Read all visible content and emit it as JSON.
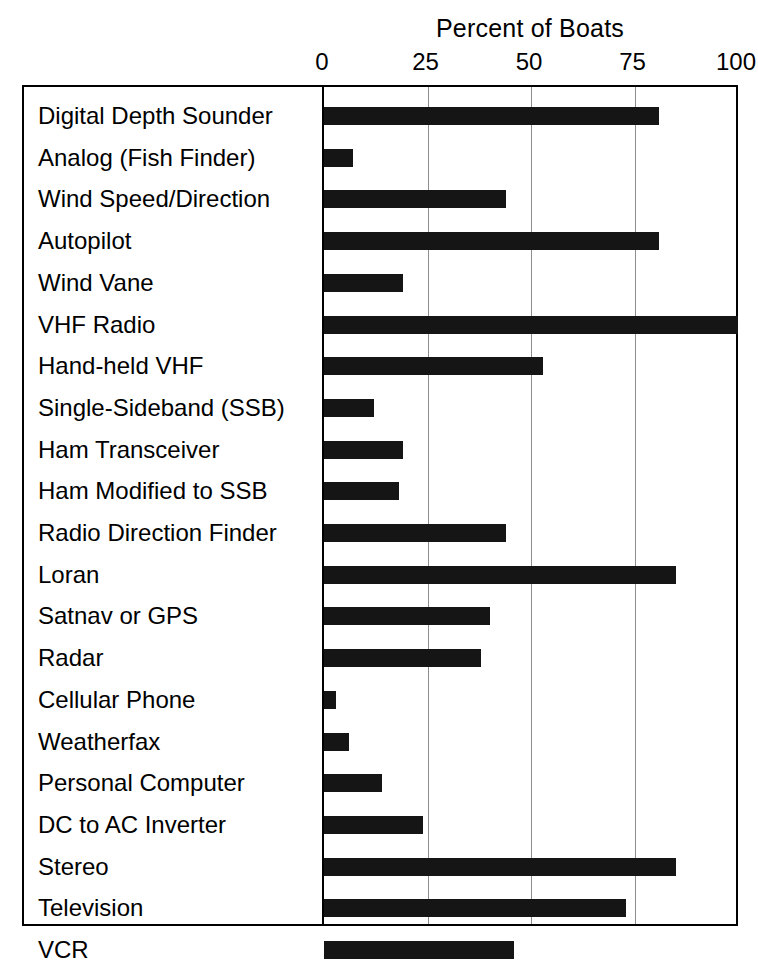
{
  "chart_data": {
    "type": "bar",
    "orientation": "horizontal",
    "title": "Percent of Boats",
    "xlabel": "",
    "ylabel": "",
    "xlim": [
      0,
      100
    ],
    "xticks": [
      0,
      25,
      50,
      75,
      100
    ],
    "xtick_labels": [
      "0",
      "25",
      "50",
      "75",
      "100"
    ],
    "grid": "vertical",
    "legend": "none",
    "bar_color": "#151515",
    "categories": [
      "Digital Depth Sounder",
      "Analog (Fish Finder)",
      "Wind Speed/Direction",
      "Autopilot",
      "Wind Vane",
      "VHF Radio",
      "Hand-held VHF",
      "Single-Sideband (SSB)",
      "Ham Transceiver",
      "Ham Modified to SSB",
      "Radio Direction Finder",
      "Loran",
      "Satnav or GPS",
      "Radar",
      "Cellular Phone",
      "Weatherfax",
      "Personal Computer",
      "DC to AC Inverter",
      "Stereo",
      "Television",
      "VCR"
    ],
    "values": [
      81,
      7,
      44,
      81,
      19,
      100,
      53,
      12,
      19,
      18,
      44,
      85,
      40,
      38,
      3,
      6,
      14,
      24,
      85,
      73,
      46
    ]
  },
  "chart": {
    "title": "Percent of Boats",
    "axis": {
      "ticks": [
        {
          "label": "0",
          "value": 0
        },
        {
          "label": "25",
          "value": 25
        },
        {
          "label": "50",
          "value": 50
        },
        {
          "label": "75",
          "value": 75
        },
        {
          "label": "100",
          "value": 100
        }
      ]
    },
    "rows": [
      {
        "label": "Digital Depth Sounder",
        "value": 81
      },
      {
        "label": "Analog (Fish Finder)",
        "value": 7
      },
      {
        "label": "Wind Speed/Direction",
        "value": 44
      },
      {
        "label": "Autopilot",
        "value": 81
      },
      {
        "label": "Wind Vane",
        "value": 19
      },
      {
        "label": "VHF Radio",
        "value": 100
      },
      {
        "label": "Hand-held VHF",
        "value": 53
      },
      {
        "label": "Single-Sideband (SSB)",
        "value": 12
      },
      {
        "label": "Ham Transceiver",
        "value": 19
      },
      {
        "label": "Ham Modified to SSB",
        "value": 18
      },
      {
        "label": "Radio Direction Finder",
        "value": 44
      },
      {
        "label": "Loran",
        "value": 85
      },
      {
        "label": "Satnav or GPS",
        "value": 40
      },
      {
        "label": "Radar",
        "value": 38
      },
      {
        "label": "Cellular Phone",
        "value": 3
      },
      {
        "label": "Weatherfax",
        "value": 6
      },
      {
        "label": "Personal Computer",
        "value": 14
      },
      {
        "label": "DC to AC Inverter",
        "value": 24
      },
      {
        "label": "Stereo",
        "value": 85
      },
      {
        "label": "Television",
        "value": 73
      },
      {
        "label": "VCR",
        "value": 46
      }
    ]
  }
}
